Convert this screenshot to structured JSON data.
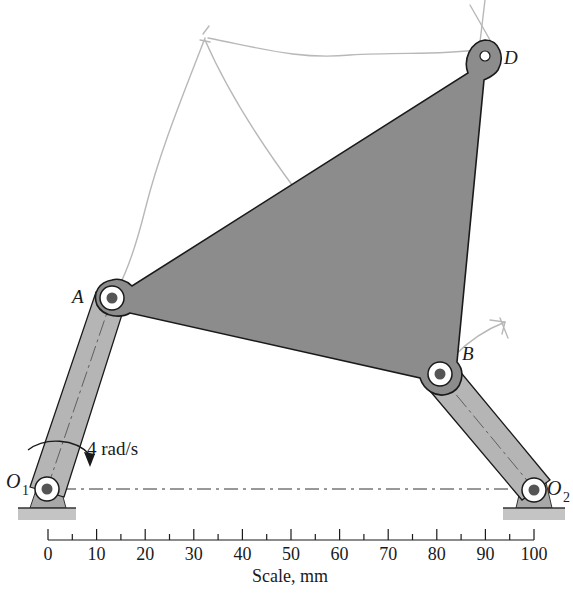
{
  "figure": {
    "colors": {
      "plate_fill": "#8c8c8c",
      "link_fill": "#b5b5b5",
      "ground_fill": "#a8a8a8",
      "outline": "#1a1a1a",
      "pencil": "#b0b0b0",
      "pin_dot": "#555555"
    }
  },
  "points": {
    "O1": {
      "label": "O",
      "sub": "1"
    },
    "O2": {
      "label": "O",
      "sub": "2"
    },
    "A": {
      "label": "A"
    },
    "B": {
      "label": "B"
    },
    "D": {
      "label": "D"
    }
  },
  "angular_velocity": {
    "label": "4 rad/s",
    "direction": "clockwise"
  },
  "scale": {
    "title": "Scale, mm",
    "ticks": [
      "0",
      "10",
      "20",
      "30",
      "40",
      "50",
      "60",
      "70",
      "80",
      "90",
      "100"
    ]
  },
  "annotations": {
    "pencil_marks": "hand-drawn construction lines (instant center sketch)"
  }
}
